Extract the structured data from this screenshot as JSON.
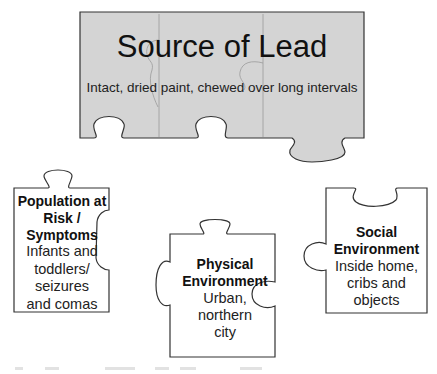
{
  "diagram": {
    "source": {
      "title": "Source of Lead",
      "subtitle": "Intact, dried paint, chewed over long intervals",
      "fill": "#d4d4d4",
      "stroke": "#333333"
    },
    "pieces": [
      {
        "id": "population",
        "heading_lines": [
          "Population at",
          "Risk /",
          "Symptoms"
        ],
        "body_lines": [
          "Infants and",
          "toddlers/",
          "seizures",
          "and comas"
        ]
      },
      {
        "id": "physical",
        "heading_lines": [
          "Physical",
          "Environment"
        ],
        "body_lines": [
          "Urban,",
          "northern",
          "city"
        ]
      },
      {
        "id": "social",
        "heading_lines": [
          "Social",
          "Environment"
        ],
        "body_lines": [
          "Inside home,",
          "cribs and",
          "objects"
        ]
      }
    ],
    "piece_fill": "#ffffff",
    "piece_stroke": "#333333"
  }
}
